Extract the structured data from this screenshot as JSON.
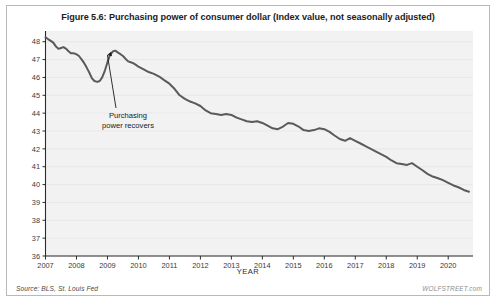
{
  "figure": {
    "title": "Figure 5.6: Purchasing power of consumer dollar (Index value, not seasonally adjusted)",
    "source_note": "Source: BLS, St. Louis Fed",
    "watermark": "WOLFSTREET.com"
  },
  "annotation": {
    "line1": "Purchasing",
    "line2": "power recovers"
  },
  "chart_data": {
    "type": "line",
    "title": "Figure 5.6: Purchasing power of consumer dollar (Index value, not seasonally adjusted)",
    "xlabel": "YEAR",
    "ylabel": "",
    "xlim": [
      2007.0,
      2020.8
    ],
    "ylim": [
      36,
      48.6
    ],
    "grid": true,
    "legend": false,
    "xticks": [
      2007,
      2008,
      2009,
      2010,
      2011,
      2012,
      2013,
      2014,
      2015,
      2016,
      2017,
      2018,
      2019,
      2020
    ],
    "xticklabels": [
      "2007",
      "2008",
      "2009",
      "2010",
      "2011",
      "2012",
      "2013",
      "2014",
      "2015",
      "2016",
      "2017",
      "2018",
      "2019",
      "2020"
    ],
    "yticks": [
      36,
      37,
      38,
      39,
      40,
      41,
      42,
      43,
      44,
      45,
      46,
      47,
      48
    ],
    "yticklabels": [
      "36",
      "37",
      "38",
      "39",
      "40",
      "41",
      "42",
      "43",
      "44",
      "45",
      "46",
      "47",
      "48"
    ],
    "series": [
      {
        "name": "Purchasing power of consumer dollar",
        "color": "#5a5a5a",
        "x": [
          2007.0,
          2007.08,
          2007.17,
          2007.25,
          2007.33,
          2007.42,
          2007.5,
          2007.58,
          2007.67,
          2007.75,
          2007.83,
          2007.92,
          2008.0,
          2008.08,
          2008.17,
          2008.25,
          2008.33,
          2008.42,
          2008.5,
          2008.58,
          2008.67,
          2008.75,
          2008.83,
          2008.92,
          2009.0,
          2009.08,
          2009.17,
          2009.25,
          2009.33,
          2009.42,
          2009.5,
          2009.58,
          2009.67,
          2009.75,
          2009.83,
          2009.92,
          2010.0,
          2010.17,
          2010.33,
          2010.5,
          2010.67,
          2010.83,
          2011.0,
          2011.17,
          2011.33,
          2011.5,
          2011.67,
          2011.83,
          2012.0,
          2012.17,
          2012.33,
          2012.5,
          2012.67,
          2012.83,
          2013.0,
          2013.17,
          2013.33,
          2013.5,
          2013.67,
          2013.83,
          2014.0,
          2014.17,
          2014.33,
          2014.5,
          2014.67,
          2014.83,
          2015.0,
          2015.17,
          2015.33,
          2015.5,
          2015.67,
          2015.83,
          2016.0,
          2016.17,
          2016.33,
          2016.5,
          2016.67,
          2016.83,
          2017.0,
          2017.17,
          2017.33,
          2017.5,
          2017.67,
          2017.83,
          2018.0,
          2018.17,
          2018.33,
          2018.5,
          2018.67,
          2018.83,
          2019.0,
          2019.17,
          2019.33,
          2019.5,
          2019.67,
          2019.83,
          2020.0,
          2020.17,
          2020.33,
          2020.5,
          2020.67
        ],
        "y": [
          48.25,
          48.15,
          48.05,
          47.95,
          47.75,
          47.6,
          47.65,
          47.7,
          47.6,
          47.45,
          47.35,
          47.35,
          47.3,
          47.2,
          47.0,
          46.8,
          46.55,
          46.25,
          45.95,
          45.8,
          45.75,
          45.8,
          46.0,
          46.4,
          46.85,
          47.25,
          47.45,
          47.5,
          47.4,
          47.3,
          47.2,
          47.05,
          46.9,
          46.85,
          46.8,
          46.7,
          46.6,
          46.45,
          46.3,
          46.2,
          46.05,
          45.85,
          45.65,
          45.35,
          45.0,
          44.8,
          44.65,
          44.55,
          44.4,
          44.15,
          44.0,
          43.95,
          43.9,
          43.95,
          43.9,
          43.75,
          43.65,
          43.55,
          43.5,
          43.55,
          43.45,
          43.3,
          43.15,
          43.1,
          43.25,
          43.45,
          43.4,
          43.25,
          43.05,
          43.0,
          43.05,
          43.15,
          43.1,
          42.95,
          42.75,
          42.55,
          42.45,
          42.6,
          42.45,
          42.3,
          42.15,
          42.0,
          41.85,
          41.7,
          41.55,
          41.35,
          41.2,
          41.15,
          41.1,
          41.2,
          41.0,
          40.8,
          40.6,
          40.45,
          40.35,
          40.25,
          40.1,
          39.95,
          39.85,
          39.7,
          39.6
        ]
      }
    ],
    "annotations": [
      {
        "text": "Purchasing power recovers",
        "point_x": 2008.95,
        "point_y": 47.45
      }
    ]
  }
}
